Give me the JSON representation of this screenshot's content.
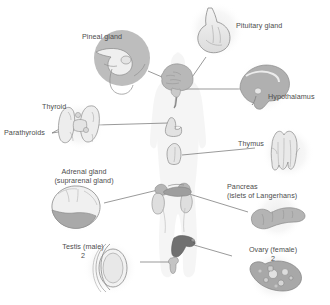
{
  "figure": {
    "background_color": "#ffffff",
    "text_color": "#4d4d4d",
    "line_color": "#6e6e6e"
  },
  "labels": {
    "pineal_gland": "Pineal gland",
    "pituitary_gland": "Pituitary gland",
    "hypothalamus": "Hypothalamus",
    "thyroid": "Thyroid",
    "parathyroids": "Parathyroids",
    "thymus": "Thymus",
    "adrenal_gland_line1": "Adrenal gland",
    "adrenal_gland_line2": "(suprarenal gland)",
    "pancreas_line1": "Pancreas",
    "pancreas_line2": "(islets of Langerhans)",
    "testis_line1": "Testis (male)",
    "testis_line2": "2",
    "ovary_line1": "Ovary (female)",
    "ovary_line2": "2"
  },
  "organs": {
    "body_silhouette": "human-body-outline",
    "brain": "brain-sagittal-section",
    "pineal_inset": "pineal-gland-closeup",
    "pituitary_inset": "pituitary-gland-closeup",
    "hypothalamus_inset": "hypothalamus-brain-closeup",
    "thyroid_inset": "thyroid-parathyroid-closeup",
    "thyroid_body": "thyroid-in-neck",
    "thymus_inset": "thymus-closeup",
    "thymus_body": "thymus-in-chest",
    "adrenal_inset": "adrenal-gland-closeup",
    "adrenal_body": "adrenal-glands-on-kidneys",
    "pancreas_inset": "pancreas-closeup",
    "pancreas_body": "pancreas-in-abdomen",
    "testis_inset": "testis-closeup",
    "testis_body": "testis-in-pelvis",
    "ovary_inset": "ovary-closeup",
    "ovary_body": "uterus-ovaries-in-pelvis"
  },
  "colors": {
    "silhouette": "#f0f0f0",
    "inset_halo": "#f2f2f2",
    "organ_light": "#e8e8e8",
    "organ_mid": "#cfcfcf",
    "organ_dark": "#a8a8a8",
    "outline": "#8a8a8a"
  }
}
